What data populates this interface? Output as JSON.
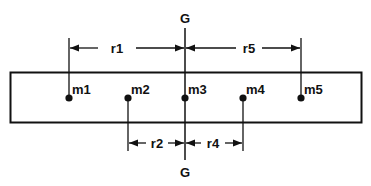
{
  "diagram": {
    "type": "beam-with-point-masses",
    "colors": {
      "ink": "#111111",
      "background": "#ffffff"
    },
    "axis": {
      "top_label": "G",
      "bottom_label": "G"
    },
    "masses": [
      {
        "id": "m1",
        "label": "m1",
        "x": 69
      },
      {
        "id": "m2",
        "label": "m2",
        "x": 128
      },
      {
        "id": "m3",
        "label": "m3",
        "x": 185
      },
      {
        "id": "m4",
        "label": "m4",
        "x": 243
      },
      {
        "id": "m5",
        "label": "m5",
        "x": 301
      }
    ],
    "dimensions": {
      "r1": {
        "label": "r1",
        "from": "m1",
        "to": "G",
        "position": "above"
      },
      "r5": {
        "label": "r5",
        "from": "G",
        "to": "m5",
        "position": "above"
      },
      "r2": {
        "label": "r2",
        "from": "m2",
        "to": "G",
        "position": "below"
      },
      "r4": {
        "label": "r4",
        "from": "G",
        "to": "m4",
        "position": "below"
      }
    }
  }
}
